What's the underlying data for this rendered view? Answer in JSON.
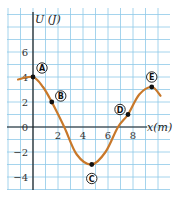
{
  "chart_data": {
    "type": "line",
    "title": "",
    "xlabel": "x(m)",
    "ylabel": "U (J)",
    "xlim": [
      -2,
      10.5
    ],
    "ylim": [
      -5,
      9
    ],
    "x_ticks": [
      "2",
      "4",
      "6",
      "8"
    ],
    "y_ticks": [
      "6",
      "4",
      "2",
      "0",
      "−2",
      "−4"
    ],
    "grid": true,
    "colors": {
      "grid": "#8ec9e8",
      "curve": "#c8782a",
      "axis": "#1a1a1a",
      "point": "#111111"
    },
    "series": [
      {
        "name": "U(x)",
        "x": [
          -1.2,
          0,
          0.8,
          1.5,
          2.5,
          3.5,
          4.7,
          5.8,
          6.8,
          7.6,
          8.5,
          9.5,
          10.2
        ],
        "values": [
          3.8,
          4,
          3.2,
          2,
          0,
          -2.2,
          -3,
          -2,
          0,
          1,
          2.6,
          3.2,
          2.5
        ]
      }
    ],
    "points": [
      {
        "label": "A",
        "x": 0,
        "y": 4
      },
      {
        "label": "B",
        "x": 1.5,
        "y": 2
      },
      {
        "label": "C",
        "x": 4.7,
        "y": -3
      },
      {
        "label": "D",
        "x": 7.6,
        "y": 1
      },
      {
        "label": "E",
        "x": 9.5,
        "y": 3.2
      }
    ]
  }
}
